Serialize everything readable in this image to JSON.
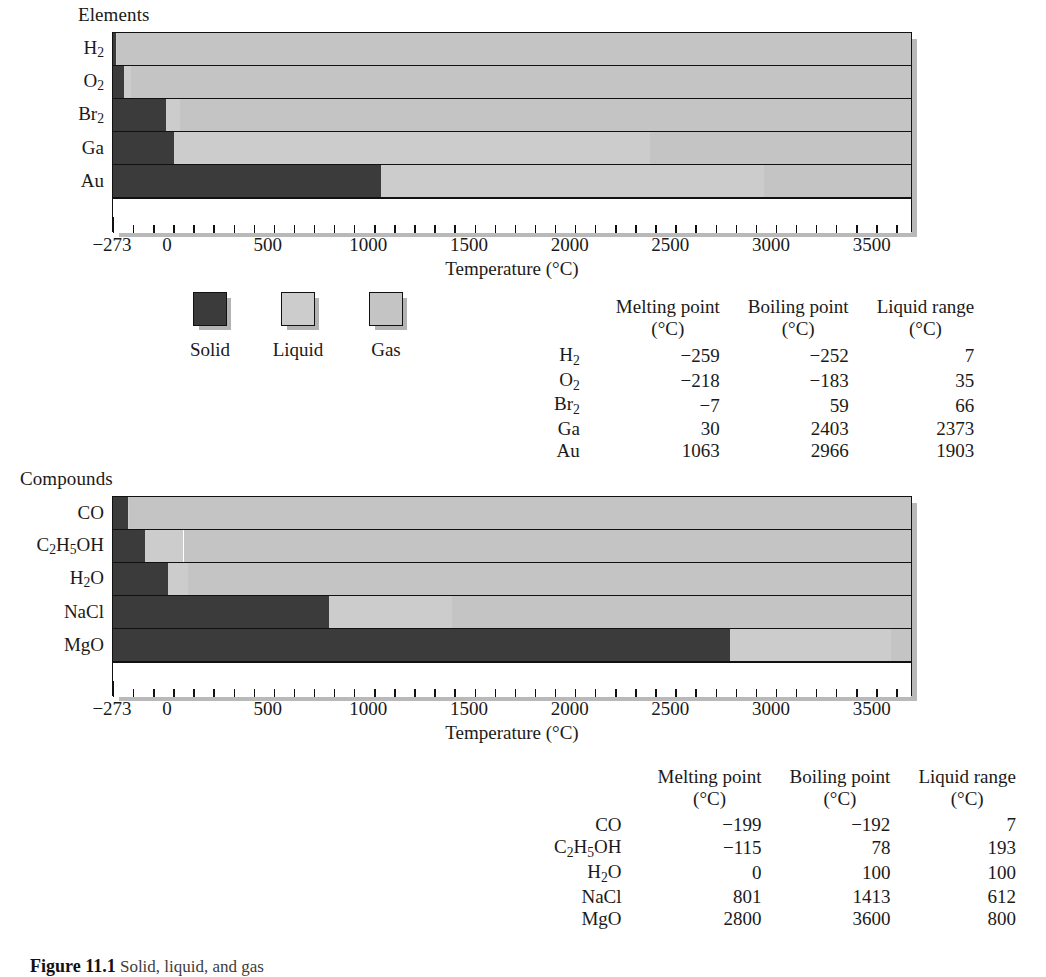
{
  "figure": {
    "caption_prefix": "Figure 11.1",
    "caption_text": "Solid, liquid, and gas"
  },
  "axis": {
    "title": "Temperature (°C)",
    "tick_labels": [
      "−273",
      "0",
      "500",
      "1000",
      "1500",
      "2000",
      "2500",
      "3000",
      "3500"
    ],
    "tick_values": [
      -273,
      0,
      500,
      1000,
      1500,
      2000,
      2500,
      3000,
      3500
    ],
    "min": -273,
    "max": 3700,
    "minor_step": 100
  },
  "legend": {
    "items": [
      {
        "label": "Solid",
        "color": "#3b3b3b"
      },
      {
        "label": "Liquid",
        "color": "#cccccc"
      },
      {
        "label": "Gas",
        "color": "#c4c4c4"
      }
    ]
  },
  "elements_panel": {
    "title": "Elements",
    "rows": [
      "H2",
      "O2",
      "Br2",
      "Ga",
      "Au"
    ],
    "row_labels_html": [
      "H<sub>2</sub>",
      "O<sub>2</sub>",
      "Br<sub>2</sub>",
      "Ga",
      "Au"
    ]
  },
  "compounds_panel": {
    "title": "Compounds",
    "rows": [
      "CO",
      "C2H5OH",
      "H2O",
      "NaCl",
      "MgO"
    ],
    "row_labels_html": [
      "CO",
      "C<sub>2</sub>H<sub>5</sub>OH",
      "H<sub>2</sub>O",
      "NaCl",
      "MgO"
    ]
  },
  "table_headers": {
    "melting": "Melting point",
    "boiling": "Boiling point",
    "liquid_range": "Liquid range",
    "unit": "(°C)"
  },
  "elements_table": {
    "rows": [
      {
        "name": "H2",
        "name_html": "H<sub>2</sub>",
        "melting": "−259",
        "boiling": "−252",
        "range": "7"
      },
      {
        "name": "O2",
        "name_html": "O<sub>2</sub>",
        "melting": "−218",
        "boiling": "−183",
        "range": "35"
      },
      {
        "name": "Br2",
        "name_html": "Br<sub>2</sub>",
        "melting": "−7",
        "boiling": "59",
        "range": "66"
      },
      {
        "name": "Ga",
        "name_html": "Ga",
        "melting": "30",
        "boiling": "2403",
        "range": "2373"
      },
      {
        "name": "Au",
        "name_html": "Au",
        "melting": "1063",
        "boiling": "2966",
        "range": "1903"
      }
    ]
  },
  "compounds_table": {
    "rows": [
      {
        "name": "CO",
        "name_html": "CO",
        "melting": "−199",
        "boiling": "−192",
        "range": "7"
      },
      {
        "name": "C2H5OH",
        "name_html": "C<sub>2</sub>H<sub>5</sub>OH",
        "melting": "−115",
        "boiling": "78",
        "range": "193"
      },
      {
        "name": "H2O",
        "name_html": "H<sub>2</sub>O",
        "melting": "0",
        "boiling": "100",
        "range": "100"
      },
      {
        "name": "NaCl",
        "name_html": "NaCl",
        "melting": "801",
        "boiling": "1413",
        "range": "612"
      },
      {
        "name": "MgO",
        "name_html": "MgO",
        "melting": "2800",
        "boiling": "3600",
        "range": "800"
      }
    ]
  },
  "chart_data": [
    {
      "type": "bar",
      "orientation": "horizontal",
      "title": "Elements",
      "xlabel": "Temperature (°C)",
      "ylabel": "",
      "xlim": [
        -273,
        3700
      ],
      "grid": false,
      "legend": [
        "Solid",
        "Liquid",
        "Gas"
      ],
      "legend_position": "below-left",
      "categories": [
        "H2",
        "O2",
        "Br2",
        "Ga",
        "Au"
      ],
      "series": [
        {
          "name": "Melting point",
          "values": [
            -259,
            -218,
            -7,
            30,
            1063
          ]
        },
        {
          "name": "Boiling point",
          "values": [
            -252,
            -183,
            59,
            2403,
            2966
          ]
        },
        {
          "name": "Liquid range",
          "values": [
            7,
            35,
            66,
            2373,
            1903
          ]
        }
      ],
      "stacked_phases": [
        {
          "category": "H2",
          "solid": [
            -273,
            -259
          ],
          "liquid": [
            -259,
            -252
          ],
          "gas": [
            -252,
            3700
          ]
        },
        {
          "category": "O2",
          "solid": [
            -273,
            -218
          ],
          "liquid": [
            -218,
            -183
          ],
          "gas": [
            -183,
            3700
          ]
        },
        {
          "category": "Br2",
          "solid": [
            -273,
            -7
          ],
          "liquid": [
            -7,
            59
          ],
          "gas": [
            59,
            3700
          ]
        },
        {
          "category": "Ga",
          "solid": [
            -273,
            30
          ],
          "liquid": [
            30,
            2403
          ],
          "gas": [
            2403,
            3700
          ]
        },
        {
          "category": "Au",
          "solid": [
            -273,
            1063
          ],
          "liquid": [
            1063,
            2966
          ],
          "gas": [
            2966,
            3700
          ]
        }
      ]
    },
    {
      "type": "bar",
      "orientation": "horizontal",
      "title": "Compounds",
      "xlabel": "Temperature (°C)",
      "ylabel": "",
      "xlim": [
        -273,
        3700
      ],
      "grid": false,
      "legend": [
        "Solid",
        "Liquid",
        "Gas"
      ],
      "legend_position": "shared",
      "categories": [
        "CO",
        "C2H5OH",
        "H2O",
        "NaCl",
        "MgO"
      ],
      "series": [
        {
          "name": "Melting point",
          "values": [
            -199,
            -115,
            0,
            801,
            2800
          ]
        },
        {
          "name": "Boiling point",
          "values": [
            -192,
            78,
            100,
            1413,
            3600
          ]
        },
        {
          "name": "Liquid range",
          "values": [
            7,
            193,
            100,
            612,
            800
          ]
        }
      ],
      "stacked_phases": [
        {
          "category": "CO",
          "solid": [
            -273,
            -199
          ],
          "liquid": [
            -199,
            -192
          ],
          "gas": [
            -192,
            3700
          ]
        },
        {
          "category": "C2H5OH",
          "solid": [
            -273,
            -115
          ],
          "liquid": [
            -115,
            78
          ],
          "gas": [
            78,
            3700
          ]
        },
        {
          "category": "H2O",
          "solid": [
            -273,
            0
          ],
          "liquid": [
            0,
            100
          ],
          "gas": [
            100,
            3700
          ]
        },
        {
          "category": "NaCl",
          "solid": [
            -273,
            801
          ],
          "liquid": [
            801,
            1413
          ],
          "gas": [
            1413,
            3700
          ]
        },
        {
          "category": "MgO",
          "solid": [
            -273,
            2800
          ],
          "liquid": [
            2800,
            3600
          ],
          "gas": [
            3600,
            3700
          ]
        }
      ]
    }
  ]
}
